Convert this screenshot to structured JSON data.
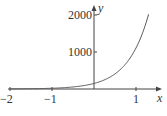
{
  "chart_data": {
    "type": "line",
    "title": "",
    "xlabel": "x",
    "ylabel": "y",
    "xlim": [
      -2,
      1.4
    ],
    "ylim": [
      0,
      2200
    ],
    "x_ticks": [
      "-2",
      "-1",
      "1"
    ],
    "y_ticks": [
      "1000",
      "2000"
    ],
    "grid": false,
    "legend": null,
    "series": [
      {
        "name": "curve",
        "function": "y = 150 e^(2x) (approx.)",
        "x": [
          -2,
          -1.5,
          -1,
          -0.5,
          0,
          0.5,
          1,
          1.3
        ],
        "y": [
          3,
          7,
          20,
          55,
          150,
          408,
          1108,
          2020
        ]
      }
    ]
  },
  "labels": {
    "x_axis": "x",
    "y_axis": "y",
    "tick_x_neg2": "−2",
    "tick_x_neg1": "−1",
    "tick_x_1": "1",
    "tick_y_1000": "1000",
    "tick_y_2000": "2000"
  }
}
